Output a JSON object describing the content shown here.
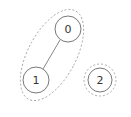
{
  "diagram": {
    "type": "graph-components",
    "nodes": [
      {
        "id": "0",
        "label": "0",
        "cx": 68,
        "cy": 29,
        "r": 13
      },
      {
        "id": "1",
        "label": "1",
        "cx": 36,
        "cy": 80,
        "r": 13
      },
      {
        "id": "2",
        "label": "2",
        "cx": 100,
        "cy": 80,
        "r": 12
      }
    ],
    "edges": [
      {
        "from": "0",
        "to": "1"
      }
    ],
    "components": [
      {
        "members": [
          "0",
          "1"
        ],
        "shape": "ellipse"
      },
      {
        "members": [
          "2"
        ],
        "shape": "circle"
      }
    ],
    "colors": {
      "node_stroke": "#555555",
      "edge": "#555555",
      "group_stroke": "#999999"
    }
  }
}
